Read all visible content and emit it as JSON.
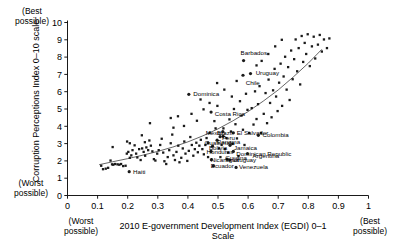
{
  "annotations": {
    "top_left": "(Best\npossible)",
    "bottom_left": "(Worst\npossible)",
    "bottom_axis_left": "(Worst\npossible)",
    "bottom_axis_right": "(Best\npossible)"
  },
  "chart_data": {
    "type": "scatter",
    "title": "",
    "xlabel": "2010 E-government Development Index (EGDI) 0–1 Scale",
    "ylabel": "Corruption Perceptions Index 0–10 scale",
    "xlim": [
      0,
      1
    ],
    "ylim": [
      0,
      10
    ],
    "xticks": [
      "0",
      "0.1",
      "0.2",
      "0.3",
      "0.4",
      "0.5",
      "0.6",
      "0.7",
      "0.8",
      "0.9",
      "1"
    ],
    "xtick_values": [
      0,
      0.1,
      0.2,
      0.3,
      0.4,
      0.5,
      0.6,
      0.7,
      0.8,
      0.9,
      1
    ],
    "yticks": [
      "0",
      "1",
      "2",
      "3",
      "4",
      "5",
      "6",
      "7",
      "8",
      "9",
      "10"
    ],
    "ytick_values": [
      0,
      1,
      2,
      3,
      4,
      5,
      6,
      7,
      8,
      9,
      10
    ],
    "grid": false,
    "legend": "none",
    "marker_color": "#1a1a1a",
    "trend_color": "#555555",
    "trendline": {
      "label": "fitted curve",
      "points": [
        [
          0.105,
          1.78
        ],
        [
          0.15,
          1.95
        ],
        [
          0.2,
          2.13
        ],
        [
          0.25,
          2.33
        ],
        [
          0.3,
          2.55
        ],
        [
          0.35,
          2.8
        ],
        [
          0.4,
          3.1
        ],
        [
          0.45,
          3.45
        ],
        [
          0.5,
          3.85
        ],
        [
          0.55,
          4.32
        ],
        [
          0.6,
          4.85
        ],
        [
          0.65,
          5.45
        ],
        [
          0.7,
          6.1
        ],
        [
          0.75,
          6.85
        ],
        [
          0.8,
          7.65
        ],
        [
          0.845,
          8.45
        ]
      ]
    },
    "labeled_points": [
      {
        "label": "Barbados",
        "x": 0.585,
        "y": 7.8,
        "lx": 0.575,
        "ly": 8.22,
        "anchor": "start"
      },
      {
        "label": "Uruguay",
        "x": 0.608,
        "y": 7.05,
        "lx": 0.625,
        "ly": 7.1,
        "anchor": "start"
      },
      {
        "label": "Chile",
        "x": 0.583,
        "y": 6.95,
        "lx": 0.592,
        "ly": 6.52,
        "anchor": "start"
      },
      {
        "label": "Dominica",
        "x": 0.403,
        "y": 5.85,
        "lx": 0.418,
        "ly": 5.86,
        "anchor": "start"
      },
      {
        "label": "Costa Rica",
        "x": 0.477,
        "y": 4.82,
        "lx": 0.489,
        "ly": 4.72,
        "anchor": "start"
      },
      {
        "label": "El Salvador",
        "x": 0.551,
        "y": 3.62,
        "lx": 0.562,
        "ly": 3.62,
        "anchor": "start"
      },
      {
        "label": "Colombia",
        "x": 0.634,
        "y": 3.48,
        "lx": 0.648,
        "ly": 3.5,
        "anchor": "start"
      },
      {
        "label": "Mexico",
        "x": 0.517,
        "y": 3.42,
        "lx": 0.459,
        "ly": 3.6,
        "anchor": "start"
      },
      {
        "label": "Peru",
        "x": 0.507,
        "y": 3.4,
        "lx": 0.513,
        "ly": 3.33,
        "anchor": "start"
      },
      {
        "label": "Brazil",
        "x": 0.516,
        "y": 3.7,
        "lx": 0.497,
        "ly": 3.62,
        "anchor": "start"
      },
      {
        "label": "Panama",
        "x": 0.497,
        "y": 3.2,
        "lx": 0.497,
        "ly": 3.08,
        "anchor": "start"
      },
      {
        "label": "Guatemala",
        "x": 0.467,
        "y": 3.05,
        "lx": 0.455,
        "ly": 3.02,
        "anchor": "start"
      },
      {
        "label": "Bolivia",
        "x": 0.482,
        "y": 2.85,
        "lx": 0.47,
        "ly": 2.78,
        "anchor": "start"
      },
      {
        "label": "Honduras",
        "x": 0.477,
        "y": 2.55,
        "lx": 0.462,
        "ly": 2.54,
        "anchor": "start"
      },
      {
        "label": "Jamaica",
        "x": 0.54,
        "y": 2.9,
        "lx": 0.553,
        "ly": 2.78,
        "anchor": "start"
      },
      {
        "label": "Dominican Republic",
        "x": 0.551,
        "y": 2.55,
        "lx": 0.561,
        "ly": 2.42,
        "anchor": "start"
      },
      {
        "label": "Argentina",
        "x": 0.598,
        "y": 2.42,
        "lx": 0.615,
        "ly": 2.3,
        "anchor": "start"
      },
      {
        "label": "Guyana",
        "x": 0.53,
        "y": 2.1,
        "lx": 0.524,
        "ly": 2.2,
        "anchor": "start"
      },
      {
        "label": "Uruguay",
        "x": 0.539,
        "y": 2.05,
        "lx": 0.549,
        "ly": 2.05,
        "anchor": "start"
      },
      {
        "label": "Nicaragua",
        "x": 0.478,
        "y": 2.07,
        "lx": 0.476,
        "ly": 2.05,
        "anchor": "start"
      },
      {
        "label": "Ecuador",
        "x": 0.485,
        "y": 1.72,
        "lx": 0.476,
        "ly": 1.72,
        "anchor": "start"
      },
      {
        "label": "Venezuela",
        "x": 0.56,
        "y": 1.62,
        "lx": 0.57,
        "ly": 1.66,
        "anchor": "start"
      },
      {
        "label": "Haiti",
        "x": 0.205,
        "y": 1.38,
        "lx": 0.218,
        "ly": 1.38,
        "anchor": "start"
      }
    ],
    "scatter_points": [
      [
        0.112,
        1.72
      ],
      [
        0.118,
        1.52
      ],
      [
        0.127,
        1.55
      ],
      [
        0.135,
        1.6
      ],
      [
        0.143,
        2.02
      ],
      [
        0.148,
        1.8
      ],
      [
        0.152,
        1.78
      ],
      [
        0.158,
        1.82
      ],
      [
        0.15,
        2.8
      ],
      [
        0.166,
        1.8
      ],
      [
        0.172,
        1.78
      ],
      [
        0.178,
        1.82
      ],
      [
        0.185,
        1.7
      ],
      [
        0.193,
        1.72
      ],
      [
        0.197,
        2.42
      ],
      [
        0.202,
        2.52
      ],
      [
        0.207,
        2.18
      ],
      [
        0.212,
        2.32
      ],
      [
        0.216,
        2.62
      ],
      [
        0.207,
        3.02
      ],
      [
        0.198,
        3.12
      ],
      [
        0.223,
        2.9
      ],
      [
        0.228,
        2.42
      ],
      [
        0.232,
        2.2
      ],
      [
        0.238,
        2.68
      ],
      [
        0.243,
        2.05
      ],
      [
        0.248,
        2.72
      ],
      [
        0.253,
        2.52
      ],
      [
        0.258,
        2.3
      ],
      [
        0.262,
        2.78
      ],
      [
        0.268,
        2.62
      ],
      [
        0.247,
        3.48
      ],
      [
        0.257,
        3.08
      ],
      [
        0.272,
        3.18
      ],
      [
        0.277,
        2.88
      ],
      [
        0.282,
        2.55
      ],
      [
        0.287,
        2.1
      ],
      [
        0.292,
        2.02
      ],
      [
        0.274,
        4.18
      ],
      [
        0.298,
        2.42
      ],
      [
        0.303,
        2.62
      ],
      [
        0.308,
        2.92
      ],
      [
        0.313,
        3.28
      ],
      [
        0.318,
        2.48
      ],
      [
        0.322,
        1.98
      ],
      [
        0.328,
        1.82
      ],
      [
        0.333,
        2.22
      ],
      [
        0.338,
        2.62
      ],
      [
        0.343,
        3.02
      ],
      [
        0.348,
        3.52
      ],
      [
        0.352,
        2.32
      ],
      [
        0.357,
        2.05
      ],
      [
        0.362,
        2.52
      ],
      [
        0.368,
        2.88
      ],
      [
        0.372,
        1.92
      ],
      [
        0.378,
        2.18
      ],
      [
        0.383,
        2.72
      ],
      [
        0.388,
        3.12
      ],
      [
        0.392,
        2.42
      ],
      [
        0.343,
        4.48
      ],
      [
        0.398,
        2.0
      ],
      [
        0.403,
        2.58
      ],
      [
        0.408,
        3.38
      ],
      [
        0.413,
        2.92
      ],
      [
        0.418,
        2.3
      ],
      [
        0.423,
        2.68
      ],
      [
        0.428,
        3.05
      ],
      [
        0.433,
        2.5
      ],
      [
        0.438,
        2.88
      ],
      [
        0.443,
        3.22
      ],
      [
        0.43,
        4.32
      ],
      [
        0.448,
        2.68
      ],
      [
        0.453,
        2.38
      ],
      [
        0.458,
        2.92
      ],
      [
        0.462,
        3.32
      ],
      [
        0.467,
        2.22
      ],
      [
        0.472,
        3.62
      ],
      [
        0.452,
        4.98
      ],
      [
        0.488,
        4.3
      ],
      [
        0.492,
        3.88
      ],
      [
        0.498,
        5.18
      ],
      [
        0.503,
        2.72
      ],
      [
        0.508,
        2.22
      ],
      [
        0.512,
        2.92
      ],
      [
        0.518,
        3.88
      ],
      [
        0.523,
        2.68
      ],
      [
        0.528,
        3.32
      ],
      [
        0.533,
        2.48
      ],
      [
        0.538,
        4.4
      ],
      [
        0.543,
        3.7
      ],
      [
        0.548,
        2.98
      ],
      [
        0.553,
        5.0
      ],
      [
        0.558,
        4.12
      ],
      [
        0.563,
        3.3
      ],
      [
        0.568,
        2.28
      ],
      [
        0.573,
        5.45
      ],
      [
        0.578,
        4.62
      ],
      [
        0.583,
        3.8
      ],
      [
        0.588,
        2.92
      ],
      [
        0.593,
        5.88
      ],
      [
        0.598,
        4.95
      ],
      [
        0.603,
        3.62
      ],
      [
        0.612,
        5.05
      ],
      [
        0.618,
        4.1
      ],
      [
        0.623,
        6.02
      ],
      [
        0.628,
        4.42
      ],
      [
        0.633,
        5.28
      ],
      [
        0.638,
        6.32
      ],
      [
        0.643,
        3.62
      ],
      [
        0.652,
        4.72
      ],
      [
        0.658,
        5.92
      ],
      [
        0.663,
        4.18
      ],
      [
        0.668,
        6.7
      ],
      [
        0.673,
        5.35
      ],
      [
        0.678,
        4.52
      ],
      [
        0.683,
        6.08
      ],
      [
        0.688,
        7.32
      ],
      [
        0.693,
        5.72
      ],
      [
        0.698,
        4.88
      ],
      [
        0.703,
        6.52
      ],
      [
        0.708,
        7.62
      ],
      [
        0.713,
        5.18
      ],
      [
        0.718,
        6.88
      ],
      [
        0.723,
        8.02
      ],
      [
        0.728,
        6.12
      ],
      [
        0.733,
        7.42
      ],
      [
        0.738,
        5.52
      ],
      [
        0.743,
        8.38
      ],
      [
        0.748,
        6.72
      ],
      [
        0.753,
        7.88
      ],
      [
        0.758,
        9.02
      ],
      [
        0.763,
        7.18
      ],
      [
        0.768,
        8.52
      ],
      [
        0.773,
        6.42
      ],
      [
        0.778,
        9.22
      ],
      [
        0.783,
        7.72
      ],
      [
        0.788,
        8.82
      ],
      [
        0.793,
        8.18
      ],
      [
        0.798,
        9.32
      ],
      [
        0.805,
        7.48
      ],
      [
        0.812,
        8.62
      ],
      [
        0.818,
        9.18
      ],
      [
        0.823,
        7.92
      ],
      [
        0.832,
        8.72
      ],
      [
        0.838,
        9.28
      ],
      [
        0.845,
        8.32
      ],
      [
        0.852,
        9.02
      ],
      [
        0.862,
        8.52
      ],
      [
        0.87,
        9.08
      ],
      [
        0.628,
        7.52
      ],
      [
        0.645,
        7.78
      ],
      [
        0.667,
        8.18
      ],
      [
        0.69,
        8.62
      ],
      [
        0.712,
        9.0
      ],
      [
        0.562,
        6.62
      ],
      [
        0.546,
        5.72
      ],
      [
        0.521,
        6.12
      ],
      [
        0.497,
        6.5
      ],
      [
        0.472,
        5.35
      ],
      [
        0.442,
        5.55
      ],
      [
        0.412,
        4.72
      ],
      [
        0.387,
        4.02
      ],
      [
        0.367,
        4.58
      ],
      [
        0.352,
        3.92
      ]
    ]
  }
}
